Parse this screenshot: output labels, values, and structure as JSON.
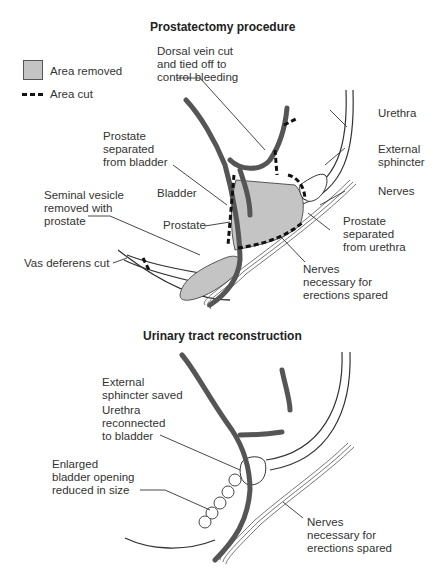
{
  "panels": [
    {
      "title": "Prostatectomy procedure",
      "legend": [
        {
          "label": "Area removed",
          "symbol": "gray-filled-square"
        },
        {
          "label": "Area cut",
          "symbol": "dashed-line"
        }
      ],
      "labels": {
        "dorsal_vein": "Dorsal vein cut\nand tied off to\ncontrol bleeding",
        "urethra": "Urethra",
        "external_sphincter": "External\nsphincter",
        "prostate_separated_bladder": "Prostate\nseparated\nfrom bladder",
        "nerves": "Nerves",
        "bladder": "Bladder",
        "seminal_vesicle": "Seminal vesicle\nremoved with\nprostate",
        "prostate": "Prostate",
        "prostate_separated_urethra": "Prostate\nseparated\nfrom urethra",
        "vas_deferens": "Vas deferens cut",
        "nerves_spared": "Nerves\nnecessary for\nerections spared"
      }
    },
    {
      "title": "Urinary tract reconstruction",
      "labels": {
        "external_sphincter_saved": "External\nsphincter saved",
        "urethra_reconnected": "Urethra\nreconnected\nto bladder",
        "bladder_opening": "Enlarged\nbladder opening\nreduced in size",
        "nerves_spared": "Nerves\nnecessary for\nerections spared"
      }
    }
  ],
  "colors": {
    "removed_area": "#c4c4c4",
    "vessel": "#555555",
    "outline": "#333333"
  }
}
